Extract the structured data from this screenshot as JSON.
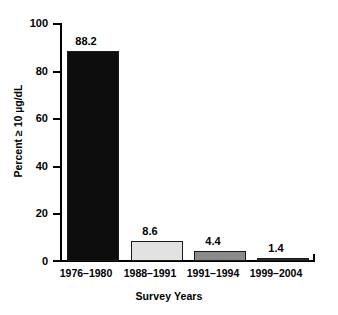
{
  "chart_data": {
    "type": "bar",
    "title": "",
    "subtitle": "",
    "xlabel": "Survey Years",
    "ylabel": "Percent ≥ 10 µg/dL",
    "categories": [
      "1976–1980",
      "1988–1991",
      "1991–1994",
      "1999–2004"
    ],
    "values": [
      88.2,
      8.6,
      4.4,
      1.4
    ],
    "value_labels": [
      "88.2",
      "8.6",
      "4.4",
      "1.4"
    ],
    "bar_colors": [
      "#0d0d0d",
      "#e2e2e2",
      "#8a8a8a",
      "#2b2b2b"
    ],
    "bar_edge_color": "#1a1a1a",
    "ylim": [
      0,
      100
    ],
    "yticks": [
      0,
      20,
      40,
      60,
      80,
      100
    ],
    "ytick_labels": [
      "0",
      "20",
      "40",
      "60",
      "80",
      "100"
    ],
    "grid": false,
    "legend": null,
    "legend_position": "none",
    "axis_color": "#000000",
    "background": "#ffffff"
  }
}
